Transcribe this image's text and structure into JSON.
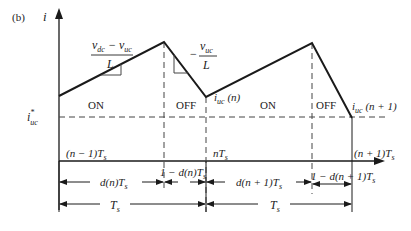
{
  "figure": {
    "panel_label": "(b)",
    "y_axis_label": "i",
    "reference_label": "i*uc"
  },
  "waveform": {
    "points": [
      [
        59,
        96
      ],
      [
        164,
        42
      ],
      [
        206,
        97
      ],
      [
        312,
        43
      ],
      [
        352,
        118
      ]
    ],
    "slope_labels": {
      "rising_numerator": "v_dc − v_uc",
      "rising_denominator": "L",
      "falling_numerator": "v_uc",
      "falling_sign": "−",
      "falling_denominator": "L"
    },
    "point_labels": {
      "valley_n": "i_uc (n)",
      "valley_n1": "i_uc (n + 1)"
    },
    "interval_labels": [
      "ON",
      "OFF",
      "ON",
      "OFF"
    ]
  },
  "time_axis": {
    "ticks": [
      "(n − 1)T_s",
      "nT_s",
      "(n + 1)T_s"
    ]
  },
  "dimensions": {
    "row1": [
      "d(n)T_s",
      "1 − d(n)T_s",
      "d(n + 1)T_s",
      "1 − d(n + 1)T_s"
    ],
    "row2": [
      "T_s",
      "T_s"
    ]
  },
  "colors": {
    "line": "#1a1a1a",
    "dashed": "#444444",
    "text": "#222222"
  }
}
